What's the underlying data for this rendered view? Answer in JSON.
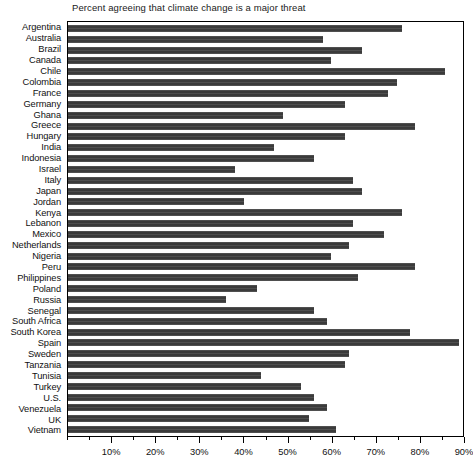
{
  "chart_data": {
    "type": "bar",
    "orientation": "horizontal",
    "title": "Percent agreeing that climate change is a major threat",
    "xlabel": "",
    "ylabel": "",
    "xlim": [
      0,
      90
    ],
    "grid": false,
    "legend": null,
    "bar_color": "#3b3b3b",
    "background_color": "#ffffff",
    "xticks": [
      {
        "value": 10,
        "label": "10%"
      },
      {
        "value": 20,
        "label": "20%"
      },
      {
        "value": 30,
        "label": "30%"
      },
      {
        "value": 40,
        "label": "40%"
      },
      {
        "value": 50,
        "label": "50%"
      },
      {
        "value": 60,
        "label": "60%"
      },
      {
        "value": 70,
        "label": "70%"
      },
      {
        "value": 80,
        "label": "80%"
      },
      {
        "value": 90,
        "label": "90%"
      }
    ],
    "minor_tick_interval": 5,
    "categories": [
      "Argentina",
      "Australia",
      "Brazil",
      "Canada",
      "Chile",
      "Colombia",
      "France",
      "Germany",
      "Ghana",
      "Greece",
      "Hungary",
      "India",
      "Indonesia",
      "Israel",
      "Italy",
      "Japan",
      "Jordan",
      "Kenya",
      "Lebanon",
      "Mexico",
      "Netherlands",
      "Nigeria",
      "Peru",
      "Philippines",
      "Poland",
      "Russia",
      "Senegal",
      "South Africa",
      "South Korea",
      "Spain",
      "Sweden",
      "Tanzania",
      "Tunisia",
      "Turkey",
      "U.S.",
      "Venezuela",
      "UK",
      "Vietnam"
    ],
    "values": [
      76,
      58,
      67,
      60,
      86,
      75,
      73,
      63,
      49,
      79,
      63,
      47,
      56,
      38,
      65,
      67,
      40,
      76,
      65,
      72,
      64,
      60,
      79,
      66,
      43,
      36,
      56,
      59,
      78,
      89,
      64,
      63,
      44,
      53,
      56,
      59,
      55,
      61
    ],
    "data_points": [
      {
        "category": "Argentina",
        "value": 76,
        "label": "76%"
      },
      {
        "category": "Australia",
        "value": 58,
        "label": "58%"
      },
      {
        "category": "Brazil",
        "value": 67,
        "label": "67%"
      },
      {
        "category": "Canada",
        "value": 60,
        "label": "60%"
      },
      {
        "category": "Chile",
        "value": 86,
        "label": "86%"
      },
      {
        "category": "Colombia",
        "value": 75,
        "label": "75%"
      },
      {
        "category": "France",
        "value": 73,
        "label": "73%"
      },
      {
        "category": "Germany",
        "value": 63,
        "label": "63%"
      },
      {
        "category": "Ghana",
        "value": 49,
        "label": "49%"
      },
      {
        "category": "Greece",
        "value": 79,
        "label": "79%"
      },
      {
        "category": "Hungary",
        "value": 63,
        "label": "63%"
      },
      {
        "category": "India",
        "value": 47,
        "label": "47%"
      },
      {
        "category": "Indonesia",
        "value": 56,
        "label": "56%"
      },
      {
        "category": "Israel",
        "value": 38,
        "label": "38%"
      },
      {
        "category": "Italy",
        "value": 65,
        "label": "65%"
      },
      {
        "category": "Japan",
        "value": 67,
        "label": "67%"
      },
      {
        "category": "Jordan",
        "value": 40,
        "label": "40%"
      },
      {
        "category": "Kenya",
        "value": 76,
        "label": "76%"
      },
      {
        "category": "Lebanon",
        "value": 65,
        "label": "65%"
      },
      {
        "category": "Mexico",
        "value": 72,
        "label": "72%"
      },
      {
        "category": "Netherlands",
        "value": 64,
        "label": "64%"
      },
      {
        "category": "Nigeria",
        "value": 60,
        "label": "60%"
      },
      {
        "category": "Peru",
        "value": 79,
        "label": "79%"
      },
      {
        "category": "Philippines",
        "value": 66,
        "label": "66%"
      },
      {
        "category": "Poland",
        "value": 43,
        "label": "43%"
      },
      {
        "category": "Russia",
        "value": 36,
        "label": "36%"
      },
      {
        "category": "Senegal",
        "value": 56,
        "label": "56%"
      },
      {
        "category": "South Africa",
        "value": 59,
        "label": "59%"
      },
      {
        "category": "South Korea",
        "value": 78,
        "label": "78%"
      },
      {
        "category": "Spain",
        "value": 89,
        "label": "89%"
      },
      {
        "category": "Sweden",
        "value": 64,
        "label": "64%"
      },
      {
        "category": "Tanzania",
        "value": 63,
        "label": "63%"
      },
      {
        "category": "Tunisia",
        "value": 44,
        "label": "44%"
      },
      {
        "category": "Turkey",
        "value": 53,
        "label": "53%"
      },
      {
        "category": "U.S.",
        "value": 56,
        "label": "56%"
      },
      {
        "category": "Venezuela",
        "value": 59,
        "label": "59%"
      },
      {
        "category": "UK",
        "value": 55,
        "label": "55%"
      },
      {
        "category": "Vietnam",
        "value": 61,
        "label": "61%"
      }
    ]
  }
}
